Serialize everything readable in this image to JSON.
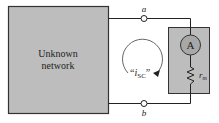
{
  "diagram": {
    "type": "circuit",
    "network_box": {
      "label_line1": "Unknown",
      "label_line2": "network",
      "fill": "#bdbdbd"
    },
    "terminals": {
      "top": "a",
      "bottom": "b"
    },
    "loop_current": {
      "label_quote_open": "“",
      "label_main": "i",
      "label_sub": "SC",
      "label_quote_close": "”",
      "direction": "clockwise"
    },
    "meter_box": {
      "fill": "#bdbdbd"
    },
    "ammeter": {
      "symbol": "A",
      "fill": "#a8a8a8"
    },
    "resistor": {
      "label_main": "r",
      "label_sub": "m"
    }
  }
}
